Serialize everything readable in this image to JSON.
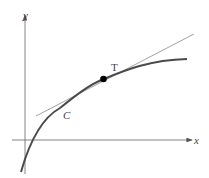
{
  "diagram": {
    "axes": {
      "x_label": "x",
      "y_label": "y"
    },
    "curve_label": "C",
    "tangent_label": "T",
    "colors": {
      "curve": "#4a4a4a",
      "tangent": "#8a8a8a",
      "axis": "#555555",
      "point": "#000000"
    }
  }
}
